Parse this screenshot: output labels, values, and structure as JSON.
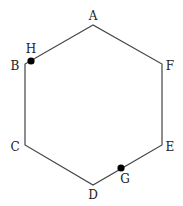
{
  "diagram": {
    "type": "hexagon",
    "vertices": [
      {
        "id": "A",
        "label": "A",
        "x": 93,
        "y": 25,
        "label_x": 93,
        "label_y": 20,
        "anchor": "middle"
      },
      {
        "id": "B",
        "label": "B",
        "x": 25,
        "y": 64,
        "label_x": 15,
        "label_y": 70,
        "anchor": "middle"
      },
      {
        "id": "C",
        "label": "C",
        "x": 25,
        "y": 145,
        "label_x": 15,
        "label_y": 151,
        "anchor": "middle"
      },
      {
        "id": "D",
        "label": "D",
        "x": 93,
        "y": 185,
        "label_x": 93,
        "label_y": 199,
        "anchor": "middle"
      },
      {
        "id": "E",
        "label": "E",
        "x": 162,
        "y": 145,
        "label_x": 170,
        "label_y": 151,
        "anchor": "middle"
      },
      {
        "id": "F",
        "label": "F",
        "x": 162,
        "y": 64,
        "label_x": 170,
        "label_y": 70,
        "anchor": "middle"
      }
    ],
    "points": [
      {
        "id": "H",
        "label": "H",
        "x": 31,
        "y": 61,
        "label_x": 31,
        "label_y": 53,
        "on_edge": "AB"
      },
      {
        "id": "G",
        "label": "G",
        "x": 121,
        "y": 168,
        "label_x": 125,
        "label_y": 183,
        "on_edge": "DE"
      }
    ],
    "stroke_color": "#444444",
    "point_color": "#000000"
  }
}
